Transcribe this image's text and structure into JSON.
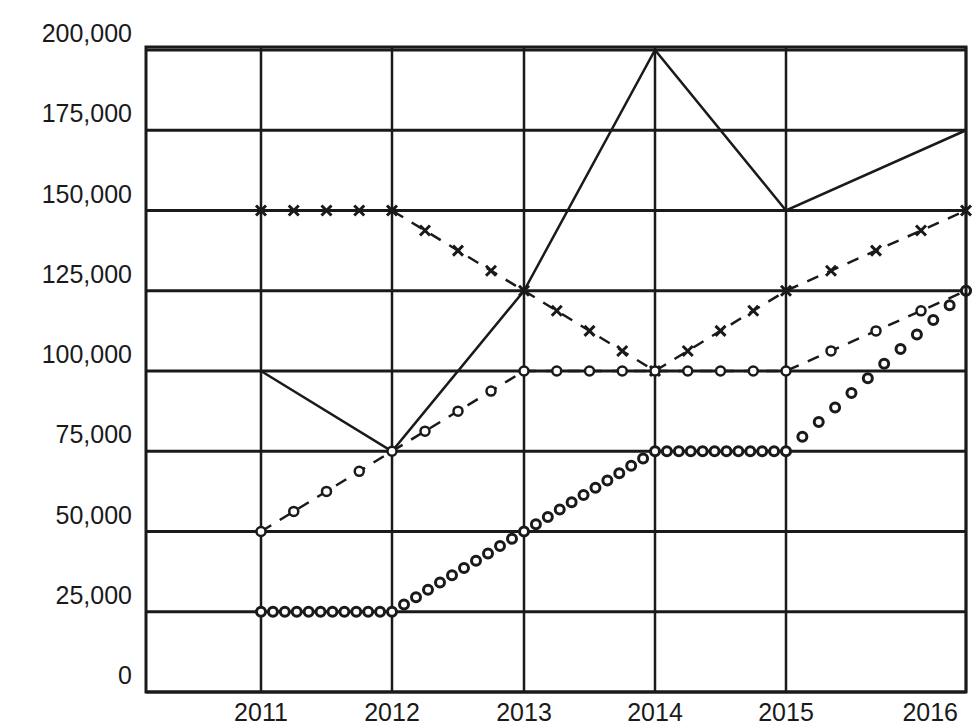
{
  "chart_data": {
    "type": "line",
    "title": "",
    "xlabel": "",
    "ylabel": "",
    "categories": [
      "2011",
      "2012",
      "2013",
      "2014",
      "2015",
      "2016"
    ],
    "x": [
      2011,
      2012,
      2013,
      2014,
      2015,
      2016
    ],
    "yticks": [
      0,
      25000,
      50000,
      75000,
      100000,
      125000,
      150000,
      175000,
      200000
    ],
    "ytick_labels": [
      "0",
      "25,000",
      "50,000",
      "75,000",
      "100,000",
      "125,000",
      "150,000",
      "175,000",
      "200,000"
    ],
    "ylim": [
      0,
      200000
    ],
    "grid": true,
    "legend": null,
    "series": [
      {
        "name": "Series A (solid line)",
        "style": "solid",
        "marker": "none",
        "values": [
          100000,
          75000,
          125000,
          200000,
          150000,
          175000
        ]
      },
      {
        "name": "Series B (dashed, x markers)",
        "style": "dashed",
        "marker": "x",
        "values": [
          150000,
          150000,
          125000,
          100000,
          125000,
          150000
        ]
      },
      {
        "name": "Series C (dashed, open circles)",
        "style": "dashed",
        "marker": "circle",
        "values": [
          50000,
          75000,
          100000,
          100000,
          100000,
          125000
        ]
      },
      {
        "name": "Series D (dotted circles)",
        "style": "dotted",
        "marker": "circle-dense",
        "values": [
          25000,
          25000,
          50000,
          75000,
          75000,
          125000
        ]
      }
    ]
  },
  "colors": {
    "ink": "#1a1a1a",
    "background": "#ffffff"
  }
}
